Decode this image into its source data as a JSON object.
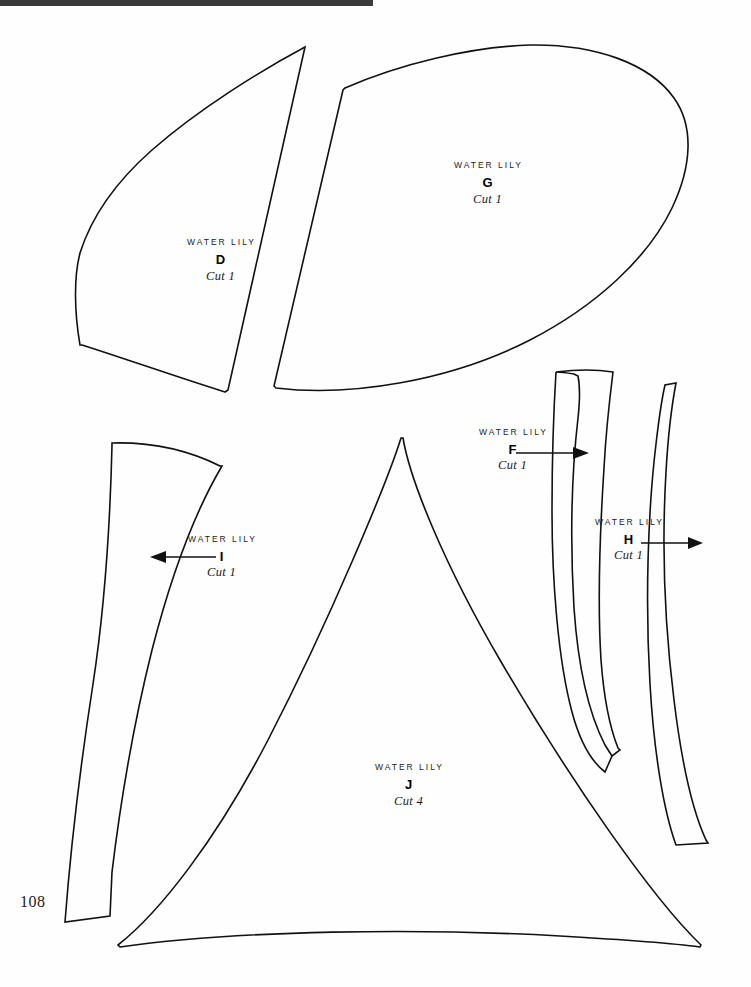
{
  "document": {
    "page_number": "108",
    "pattern_name": "WATER LILY",
    "top_rule_color": "#3a3a3a",
    "ink_color": "#111111",
    "paper_color": "#ffffff"
  },
  "pieces": [
    {
      "id": "D",
      "title": "WATER LILY",
      "letter": "D",
      "cut": "Cut 1",
      "has_arrow": false,
      "label_x": 148,
      "label_y": 238,
      "shape": "petal-leaf-pointed"
    },
    {
      "id": "G",
      "title": "WATER LILY",
      "letter": "G",
      "cut": "Cut 1",
      "has_arrow": false,
      "label_x": 452,
      "label_y": 161,
      "shape": "large-rounded-petal"
    },
    {
      "id": "F",
      "title": "WATER LILY",
      "letter": "F",
      "cut": "Cut 1",
      "has_arrow": true,
      "arrow_direction": "right",
      "label_x": 473,
      "label_y": 428,
      "shape": "curved-strip-flared-top"
    },
    {
      "id": "H",
      "title": "WATER LILY",
      "letter": "H",
      "cut": "Cut 1",
      "has_arrow": true,
      "arrow_direction": "right",
      "label_x": 596,
      "label_y": 518,
      "shape": "long-curved-band"
    },
    {
      "id": "I",
      "title": "WATER LILY",
      "letter": "I",
      "cut": "Cut 1",
      "has_arrow": true,
      "arrow_direction": "left",
      "label_x": 186,
      "label_y": 535,
      "shape": "tapered-curved-blade"
    },
    {
      "id": "J",
      "title": "WATER LILY",
      "letter": "J",
      "cut": "Cut 4",
      "has_arrow": false,
      "label_x": 371,
      "label_y": 763,
      "shape": "large-curved-triangle"
    }
  ]
}
